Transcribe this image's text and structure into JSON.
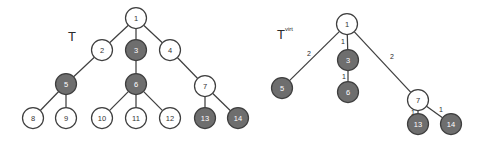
{
  "figure": {
    "background_color": "#ffffff",
    "node_plain_fill": "#ffffff",
    "node_shaded_fill": "#6e6e6e",
    "edge_color": "#3f3f3f",
    "node_radius": 10.5
  },
  "left_tree": {
    "title": "T",
    "title_superscript": "",
    "title_x": 68,
    "title_y": 36,
    "nodes": [
      {
        "id": "n1",
        "label": "1",
        "x": 136,
        "y": 18,
        "shaded": false
      },
      {
        "id": "n2",
        "label": "2",
        "x": 102,
        "y": 50,
        "shaded": false
      },
      {
        "id": "n3",
        "label": "3",
        "x": 136,
        "y": 50,
        "shaded": true
      },
      {
        "id": "n4",
        "label": "4",
        "x": 170,
        "y": 50,
        "shaded": false
      },
      {
        "id": "n5",
        "label": "5",
        "x": 66,
        "y": 84,
        "shaded": true
      },
      {
        "id": "n6",
        "label": "6",
        "x": 136,
        "y": 84,
        "shaded": true
      },
      {
        "id": "n7",
        "label": "7",
        "x": 205,
        "y": 86,
        "shaded": false
      },
      {
        "id": "n8",
        "label": "8",
        "x": 33,
        "y": 118,
        "shaded": false
      },
      {
        "id": "n9",
        "label": "9",
        "x": 66,
        "y": 118,
        "shaded": false
      },
      {
        "id": "n10",
        "label": "10",
        "x": 102,
        "y": 118,
        "shaded": false
      },
      {
        "id": "n11",
        "label": "11",
        "x": 136,
        "y": 118,
        "shaded": false
      },
      {
        "id": "n12",
        "label": "12",
        "x": 170,
        "y": 118,
        "shaded": false
      },
      {
        "id": "n13",
        "label": "13",
        "x": 205,
        "y": 118,
        "shaded": true
      },
      {
        "id": "n14",
        "label": "14",
        "x": 238,
        "y": 118,
        "shaded": true
      }
    ],
    "edges": [
      {
        "from": "n1",
        "to": "n2",
        "weight": ""
      },
      {
        "from": "n1",
        "to": "n3",
        "weight": ""
      },
      {
        "from": "n1",
        "to": "n4",
        "weight": ""
      },
      {
        "from": "n2",
        "to": "n5",
        "weight": ""
      },
      {
        "from": "n3",
        "to": "n6",
        "weight": ""
      },
      {
        "from": "n4",
        "to": "n7",
        "weight": ""
      },
      {
        "from": "n5",
        "to": "n8",
        "weight": ""
      },
      {
        "from": "n5",
        "to": "n9",
        "weight": ""
      },
      {
        "from": "n6",
        "to": "n10",
        "weight": ""
      },
      {
        "from": "n6",
        "to": "n11",
        "weight": ""
      },
      {
        "from": "n6",
        "to": "n12",
        "weight": ""
      },
      {
        "from": "n7",
        "to": "n13",
        "weight": ""
      },
      {
        "from": "n7",
        "to": "n14",
        "weight": ""
      }
    ]
  },
  "right_tree": {
    "title": "T",
    "title_superscript": "virt",
    "title_x": 277,
    "title_y": 34,
    "nodes": [
      {
        "id": "v1",
        "label": "1",
        "x": 347,
        "y": 24,
        "shaded": false
      },
      {
        "id": "v5",
        "label": "5",
        "x": 282,
        "y": 88,
        "shaded": true
      },
      {
        "id": "v3",
        "label": "3",
        "x": 348,
        "y": 60,
        "shaded": true
      },
      {
        "id": "v6",
        "label": "6",
        "x": 348,
        "y": 92,
        "shaded": true
      },
      {
        "id": "v7",
        "label": "7",
        "x": 418,
        "y": 100,
        "shaded": false
      },
      {
        "id": "v13",
        "label": "13",
        "x": 418,
        "y": 124,
        "shaded": true
      },
      {
        "id": "v14",
        "label": "14",
        "x": 451,
        "y": 124,
        "shaded": true
      }
    ],
    "edges": [
      {
        "from": "v1",
        "to": "v5",
        "weight": "2",
        "wx": 309,
        "wy": 53
      },
      {
        "from": "v1",
        "to": "v3",
        "weight": "1",
        "wx": 343,
        "wy": 41
      },
      {
        "from": "v1",
        "to": "v7",
        "weight": "2",
        "wx": 392,
        "wy": 56
      },
      {
        "from": "v3",
        "to": "v6",
        "weight": "1",
        "wx": 344,
        "wy": 76
      },
      {
        "from": "v7",
        "to": "v13",
        "weight": "1",
        "wx": 413,
        "wy": 112
      },
      {
        "from": "v7",
        "to": "v14",
        "weight": "1",
        "wx": 441,
        "wy": 109
      }
    ]
  }
}
